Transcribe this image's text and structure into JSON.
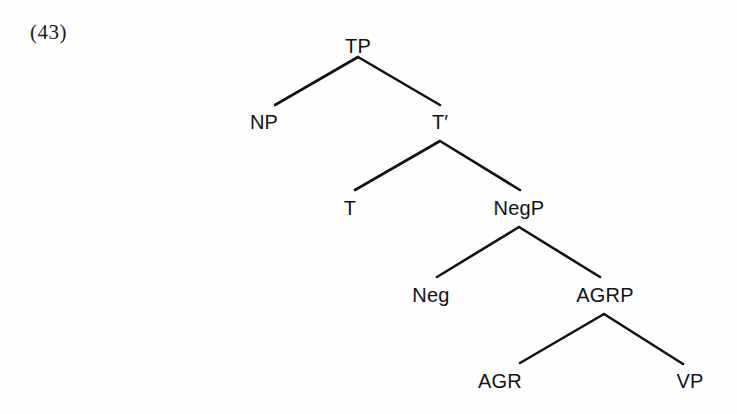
{
  "example": {
    "number_label": "(43)"
  },
  "diagram": {
    "type": "syntax-tree",
    "line_color": "#121212",
    "background_color": "#fefefe",
    "nodes": [
      {
        "id": "TP",
        "label": "TP",
        "x": 358,
        "y": 36,
        "level": 0
      },
      {
        "id": "NP",
        "label": "NP",
        "x": 264,
        "y": 112,
        "level": 1
      },
      {
        "id": "Tbar",
        "label": "T",
        "prime": "′",
        "x": 440,
        "y": 112,
        "level": 1
      },
      {
        "id": "T",
        "label": "T",
        "x": 350,
        "y": 198,
        "level": 2
      },
      {
        "id": "NegP",
        "label": "NegP",
        "x": 519,
        "y": 198,
        "level": 2
      },
      {
        "id": "Neg",
        "label": "Neg",
        "x": 431,
        "y": 285,
        "level": 3
      },
      {
        "id": "AGRP",
        "label": "AGRP",
        "x": 605,
        "y": 285,
        "level": 3
      },
      {
        "id": "AGR",
        "label": "AGR",
        "x": 500,
        "y": 371,
        "level": 4
      },
      {
        "id": "VP",
        "label": "VP",
        "x": 690,
        "y": 371,
        "level": 4
      }
    ],
    "edges": [
      {
        "from": "TP",
        "to": "NP",
        "x1": 358,
        "y1": 57,
        "x2": 275,
        "y2": 105
      },
      {
        "from": "TP",
        "to": "Tbar",
        "x1": 358,
        "y1": 57,
        "x2": 440,
        "y2": 105
      },
      {
        "from": "Tbar",
        "to": "T",
        "x1": 440,
        "y1": 141,
        "x2": 355,
        "y2": 190
      },
      {
        "from": "Tbar",
        "to": "NegP",
        "x1": 440,
        "y1": 141,
        "x2": 520,
        "y2": 190
      },
      {
        "from": "NegP",
        "to": "Neg",
        "x1": 519,
        "y1": 227,
        "x2": 437,
        "y2": 277
      },
      {
        "from": "NegP",
        "to": "AGRP",
        "x1": 519,
        "y1": 227,
        "x2": 600,
        "y2": 277
      },
      {
        "from": "AGRP",
        "to": "AGR",
        "x1": 604,
        "y1": 314,
        "x2": 520,
        "y2": 363
      },
      {
        "from": "AGRP",
        "to": "VP",
        "x1": 604,
        "y1": 314,
        "x2": 683,
        "y2": 364
      }
    ]
  }
}
